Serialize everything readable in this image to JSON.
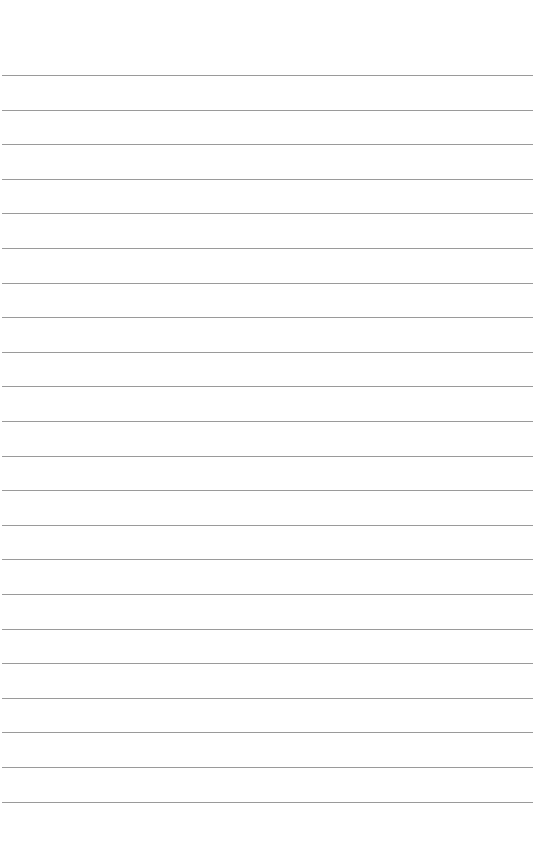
{
  "page": {
    "type": "lined-paper",
    "background": "#ffffff",
    "rule_color": "#9a9a9a",
    "rule_count": 22,
    "first_rule_y": 75,
    "rule_spacing": 34.6,
    "text": ""
  }
}
